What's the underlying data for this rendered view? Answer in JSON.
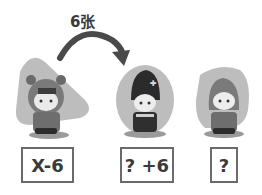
{
  "arrow": {
    "label": "6张"
  },
  "characters": [
    {
      "name": "bear-hood-child",
      "backdrop": "triangle"
    },
    {
      "name": "black-hat-child",
      "backdrop": "circle"
    },
    {
      "name": "hooded-child",
      "backdrop": "rounded-square"
    }
  ],
  "boxes": [
    {
      "label": "X-6"
    },
    {
      "label": "? +6"
    },
    {
      "label": "?"
    }
  ],
  "colors": {
    "backdrop": "#b5b5b5",
    "outline": "#6a6a6a",
    "text": "#3a3a3a"
  }
}
